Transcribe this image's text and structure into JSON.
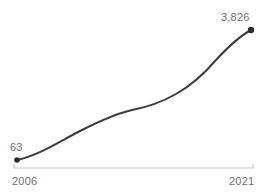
{
  "chart_data": {
    "type": "line",
    "title": "",
    "subtitle": "",
    "xlabel": "",
    "ylabel": "",
    "grid": false,
    "legend": false,
    "axis_line_color": "#c9c9c9",
    "line_color": "#3c3c3c",
    "marker_color": "#2b2b2b",
    "label_color": "#6e6e6e",
    "background": "#ffffff",
    "xlim": [
      2006,
      2021
    ],
    "ylim": [
      0,
      3826
    ],
    "x_tick_labels": [
      "2006",
      "2021"
    ],
    "endpoint_labels": {
      "start": "63",
      "end": "3,826"
    },
    "x": [
      2006,
      2007,
      2008,
      2009,
      2010,
      2011,
      2012,
      2013,
      2014,
      2015,
      2016,
      2017,
      2018,
      2019,
      2020,
      2021
    ],
    "values": [
      63,
      190,
      330,
      470,
      610,
      750,
      880,
      980,
      1060,
      1160,
      1300,
      1480,
      1760,
      2180,
      2860,
      3826
    ],
    "series": [
      {
        "name": "series-1",
        "values": [
          63,
          190,
          330,
          470,
          610,
          750,
          880,
          980,
          1060,
          1160,
          1300,
          1480,
          1760,
          2180,
          2860,
          3826
        ]
      }
    ],
    "markers": [
      {
        "name": "start-point",
        "x": 2006,
        "y": 63,
        "px": 17,
        "py": 160
      },
      {
        "name": "end-point",
        "x": 2021,
        "y": 3826,
        "px": 251,
        "py": 30
      }
    ],
    "line_path": "M 17 160 C 40 155, 60 141, 82 130 C 104 119, 118 113, 132 110 C 148 107, 162 102, 176 94 C 192 85, 204 74, 216 60 C 228 47, 240 36, 251 30",
    "axis": {
      "y_px": 168,
      "x_start_px": 14,
      "x_end_px": 253,
      "tick_height_px": 4
    }
  }
}
